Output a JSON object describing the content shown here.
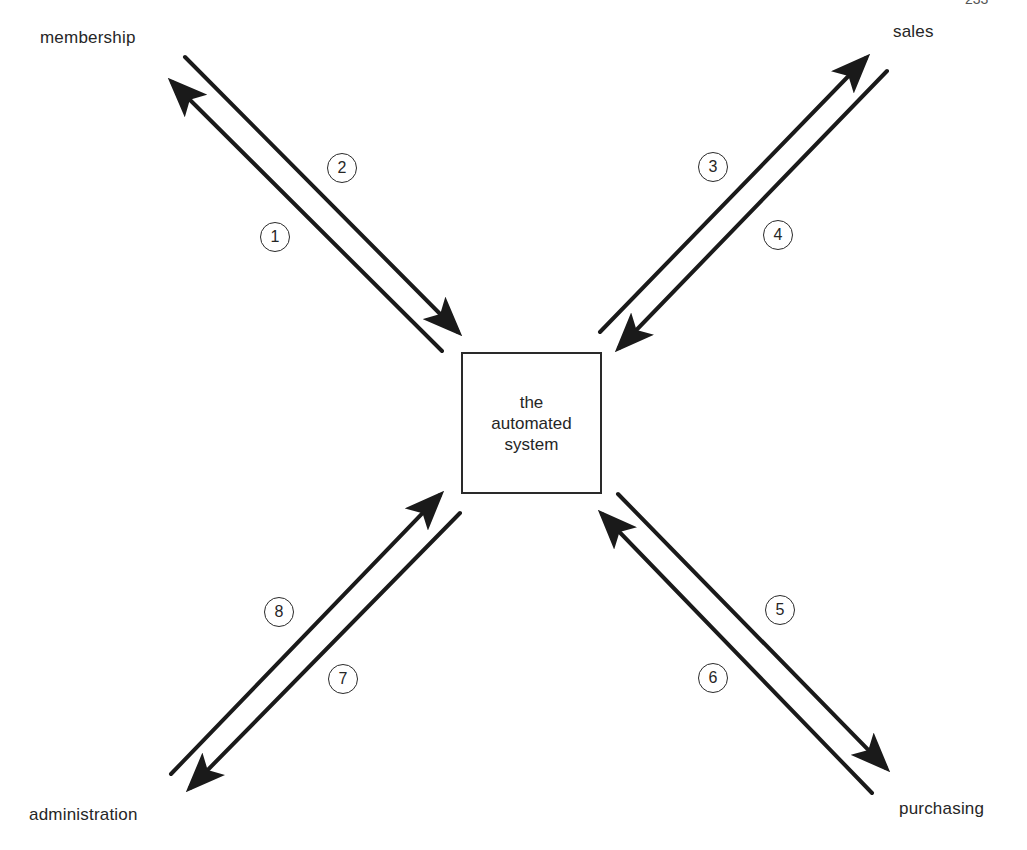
{
  "page": {
    "page_number_partial": "233"
  },
  "center": {
    "line1": "the",
    "line2": "automated",
    "line3": "system"
  },
  "entities": {
    "membership": "membership",
    "sales": "sales",
    "administration": "administration",
    "purchasing": "purchasing"
  },
  "flows": [
    {
      "id": "1",
      "from": "the automated system",
      "to": "membership"
    },
    {
      "id": "2",
      "from": "membership",
      "to": "the automated system"
    },
    {
      "id": "3",
      "from": "the automated system",
      "to": "sales"
    },
    {
      "id": "4",
      "from": "sales",
      "to": "the automated system"
    },
    {
      "id": "5",
      "from": "the automated system",
      "to": "purchasing"
    },
    {
      "id": "6",
      "from": "purchasing",
      "to": "the automated system"
    },
    {
      "id": "7",
      "from": "the automated system",
      "to": "administration"
    },
    {
      "id": "8",
      "from": "administration",
      "to": "the automated system"
    }
  ],
  "colors": {
    "ink": "#1a1a1a",
    "background": "#ffffff"
  }
}
